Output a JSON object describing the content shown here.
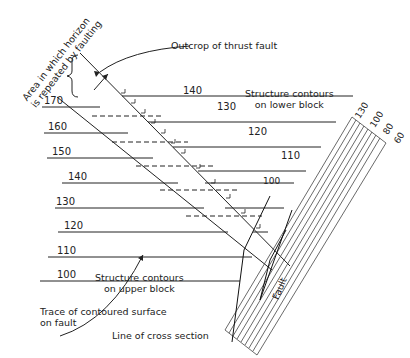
{
  "labels": {
    "bracket_note_line1": "Area in which horizon",
    "bracket_note_line2": "is repeated by faulting",
    "outcrop": "Outcrop of thrust fault",
    "lower_block_1": "Structure contours",
    "lower_block_2": "on lower block",
    "upper_block_1": "Structure contours",
    "upper_block_2": "on upper block",
    "trace_1": "Trace of contoured surface",
    "trace_2": "on fault",
    "cross_section": "Line of cross section",
    "fault": "Fault"
  },
  "upper_block_contours": [
    {
      "value": "170",
      "y": 107,
      "x0": 42,
      "lx": 44
    },
    {
      "value": "160",
      "y": 133,
      "x0": 44,
      "lx": 48
    },
    {
      "value": "150",
      "y": 158,
      "x0": 47,
      "lx": 52
    },
    {
      "value": "140",
      "y": 183,
      "x0": 62,
      "lx": 68
    },
    {
      "value": "130",
      "y": 208,
      "x0": 55,
      "lx": 56
    },
    {
      "value": "120",
      "y": 232,
      "x0": 58,
      "lx": 64
    },
    {
      "value": "110",
      "y": 257,
      "x0": 48,
      "lx": 57
    },
    {
      "value": "100",
      "y": 281,
      "x0": 40,
      "lx": 57
    }
  ],
  "lower_block_contours": [
    {
      "value": "140",
      "y": 96
    },
    {
      "value": "130",
      "y": 122
    },
    {
      "value": "120",
      "y": 147
    },
    {
      "value": "110",
      "y": 171
    },
    {
      "value": "100",
      "y": 196
    }
  ],
  "fault_zone_labels": [
    "130",
    "100",
    "80",
    "60"
  ]
}
